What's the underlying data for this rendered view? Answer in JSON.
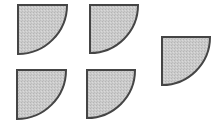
{
  "figure": {
    "fill_color": "#c9c9c9",
    "stroke_color": "#454545",
    "shapes": [
      {
        "id": "quarter-circle-1",
        "x": 18,
        "y": 5,
        "size": 49
      },
      {
        "id": "quarter-circle-2",
        "x": 90,
        "y": 5,
        "size": 48
      },
      {
        "id": "quarter-circle-3",
        "x": 17,
        "y": 70,
        "size": 49
      },
      {
        "id": "quarter-circle-4",
        "x": 87,
        "y": 70,
        "size": 48
      },
      {
        "id": "quarter-circle-5",
        "x": 162,
        "y": 37,
        "size": 48
      }
    ]
  }
}
